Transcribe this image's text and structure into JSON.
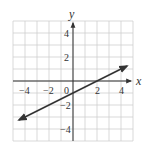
{
  "chart_data": {
    "type": "line",
    "title": "",
    "xlabel": "x",
    "ylabel": "y",
    "xlim": [
      -5,
      5
    ],
    "ylim": [
      -5,
      5
    ],
    "grid": true,
    "x_tick_labels": [
      "-4",
      "-2",
      "0",
      "2",
      "4"
    ],
    "y_tick_labels": [
      "4",
      "2",
      "-2",
      "-4"
    ],
    "series": [
      {
        "name": "line",
        "equation": "y = 0.5x - 1",
        "x": [
          -4.5,
          4.5
        ],
        "y": [
          -3.25,
          1.25
        ],
        "arrows_both_ends": true
      }
    ]
  },
  "labels": {
    "x_axis": "x",
    "y_axis": "y",
    "xt_m4": "−4",
    "xt_m2": "−2",
    "xt_0": "0",
    "xt_2": "2",
    "xt_4": "4",
    "yt_4": "4",
    "yt_2": "2",
    "yt_m2": "−2",
    "yt_m4": "−4"
  },
  "colors": {
    "grid": "#cfcfcf",
    "axis": "#333333",
    "line": "#333333"
  }
}
